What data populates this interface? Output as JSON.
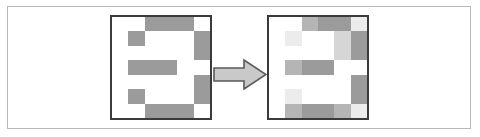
{
  "figure": {
    "title": "",
    "caption": "",
    "background_color": "#ffffff",
    "outer_frame_color": "#b8b8b8",
    "panel_border_color": "#3a3a3a"
  },
  "palette": {
    "empty": "#ffffff",
    "gray_dark": "#9b9b9b",
    "gray_mid": "#b5b5b5",
    "gray_light": "#d6d6d6",
    "gray_faint": "#ececec",
    "arrow_fill": "#c9c9c9",
    "arrow_stroke": "#5a5a5a"
  },
  "arrow": {
    "icon": "right-arrow-icon",
    "label": "",
    "direction": "right",
    "fill": "#c9c9c9",
    "stroke": "#5a5a5a"
  },
  "panels": [
    {
      "id": "source",
      "name": "source-pixel-grid",
      "label": "",
      "rows": 6,
      "cols": 6,
      "description": "sharp pixelated digit three",
      "cells": [
        [
          "#ffffff",
          "#ffffff",
          "#9b9b9b",
          "#9b9b9b",
          "#9b9b9b",
          "#ffffff"
        ],
        [
          "#ffffff",
          "#9b9b9b",
          "#ffffff",
          "#ffffff",
          "#ffffff",
          "#9b9b9b"
        ],
        [
          "#ffffff",
          "#ffffff",
          "#ffffff",
          "#ffffff",
          "#ffffff",
          "#9b9b9b"
        ],
        [
          "#ffffff",
          "#9b9b9b",
          "#9b9b9b",
          "#9b9b9b",
          "#ffffff",
          "#ffffff"
        ],
        [
          "#ffffff",
          "#ffffff",
          "#ffffff",
          "#ffffff",
          "#ffffff",
          "#9b9b9b"
        ],
        [
          "#ffffff",
          "#9b9b9b",
          "#ffffff",
          "#ffffff",
          "#ffffff",
          "#9b9b9b"
        ],
        [
          "#ffffff",
          "#ffffff",
          "#9b9b9b",
          "#9b9b9b",
          "#9b9b9b",
          "#ffffff"
        ]
      ]
    },
    {
      "id": "result",
      "name": "result-pixel-grid",
      "label": "",
      "rows": 6,
      "cols": 6,
      "description": "blurred smoothed digit three",
      "cells": [
        [
          "#ffffff",
          "#ffffff",
          "#b5b5b5",
          "#9b9b9b",
          "#9b9b9b",
          "#ececec"
        ],
        [
          "#ffffff",
          "#ececec",
          "#ffffff",
          "#ffffff",
          "#d6d6d6",
          "#9b9b9b"
        ],
        [
          "#ffffff",
          "#ffffff",
          "#ffffff",
          "#ffffff",
          "#d6d6d6",
          "#9b9b9b"
        ],
        [
          "#ffffff",
          "#b5b5b5",
          "#9b9b9b",
          "#9b9b9b",
          "#ffffff",
          "#ffffff"
        ],
        [
          "#ffffff",
          "#ffffff",
          "#ffffff",
          "#ffffff",
          "#ffffff",
          "#9b9b9b"
        ],
        [
          "#ffffff",
          "#ececec",
          "#ffffff",
          "#ffffff",
          "#ffffff",
          "#9b9b9b"
        ],
        [
          "#ffffff",
          "#b5b5b5",
          "#9b9b9b",
          "#9b9b9b",
          "#b5b5b5",
          "#ececec"
        ]
      ]
    }
  ]
}
